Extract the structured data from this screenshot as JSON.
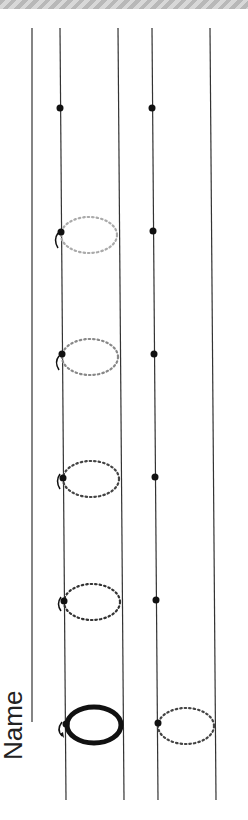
{
  "worksheet": {
    "name_label": "Name",
    "letter": "o",
    "colors": {
      "line": "#333333",
      "dot": "#111111",
      "light_trace": "#aaaaaa",
      "medium_trace": "#777777",
      "dark_trace": "#333333",
      "solid_letter": "#111111",
      "stripe": "#b8b8b8"
    },
    "rows": [
      {
        "name": "top-row",
        "guide_lines_x": [
          27,
          60,
          118
        ],
        "dot_line_x": 60
      },
      {
        "name": "bottom-row",
        "guide_lines_x": [
          152,
          210
        ],
        "dot_line_x": 152
      }
    ],
    "trace_items": [
      {
        "y": 725,
        "type": "solid"
      },
      {
        "y": 600,
        "type": "dotted-dark"
      },
      {
        "y": 477,
        "type": "dotted-dark"
      },
      {
        "y": 354,
        "type": "dotted-medium"
      },
      {
        "y": 232,
        "type": "dotted-light"
      },
      {
        "y": 108,
        "type": "dot-only"
      }
    ],
    "bottom_row_items": [
      {
        "y": 722,
        "type": "dotted-dark"
      },
      {
        "y": 600,
        "type": "dot-only"
      },
      {
        "y": 477,
        "type": "dot-only"
      },
      {
        "y": 354,
        "type": "dot-only"
      },
      {
        "y": 232,
        "type": "dot-only"
      },
      {
        "y": 108,
        "type": "dot-only"
      }
    ]
  }
}
